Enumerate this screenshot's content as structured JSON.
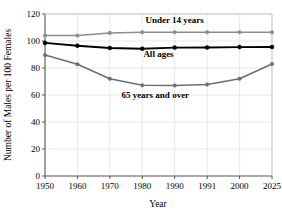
{
  "chart_data": {
    "type": "line",
    "title": "",
    "xlabel": "Year",
    "ylabel": "Number of Males per 100 Females",
    "categories": [
      "1950",
      "1960",
      "1970",
      "1980",
      "1990",
      "1991",
      "2000",
      "2025"
    ],
    "ylim": [
      0,
      120
    ],
    "yticks": [
      0,
      20,
      40,
      60,
      80,
      100,
      120
    ],
    "ytick_labels": [
      "0",
      "20",
      "40",
      "60",
      "80",
      "100",
      "120"
    ],
    "grid": true,
    "legend_position": "inline-annotations",
    "series": [
      {
        "name": "Under 14 years",
        "color": "#8c8c8c",
        "marker": "circle",
        "values": [
          104,
          104,
          106,
          106.5,
          106.5,
          106.5,
          106.5,
          106.5
        ],
        "label_x": 1990,
        "label_y": 113
      },
      {
        "name": "All ages",
        "color": "#000000",
        "marker": "circle",
        "values": [
          98.6,
          96.5,
          94.8,
          94.3,
          95.1,
          95.2,
          95.5,
          95.6
        ],
        "label_x": 1985,
        "label_y": 88
      },
      {
        "name": "65 years and over",
        "color": "#6e6e6e",
        "marker": "circle",
        "values": [
          89.6,
          82.8,
          72.0,
          67.2,
          67.0,
          67.8,
          72.0,
          83.0
        ],
        "label_x": 1984,
        "label_y": 58
      }
    ]
  },
  "axis_titles": {
    "x": "Year",
    "y": "Number of Males per 100 Females"
  },
  "annotations": {
    "under14": "Under 14 years",
    "allages": "All ages",
    "over65": "65 years and over"
  }
}
